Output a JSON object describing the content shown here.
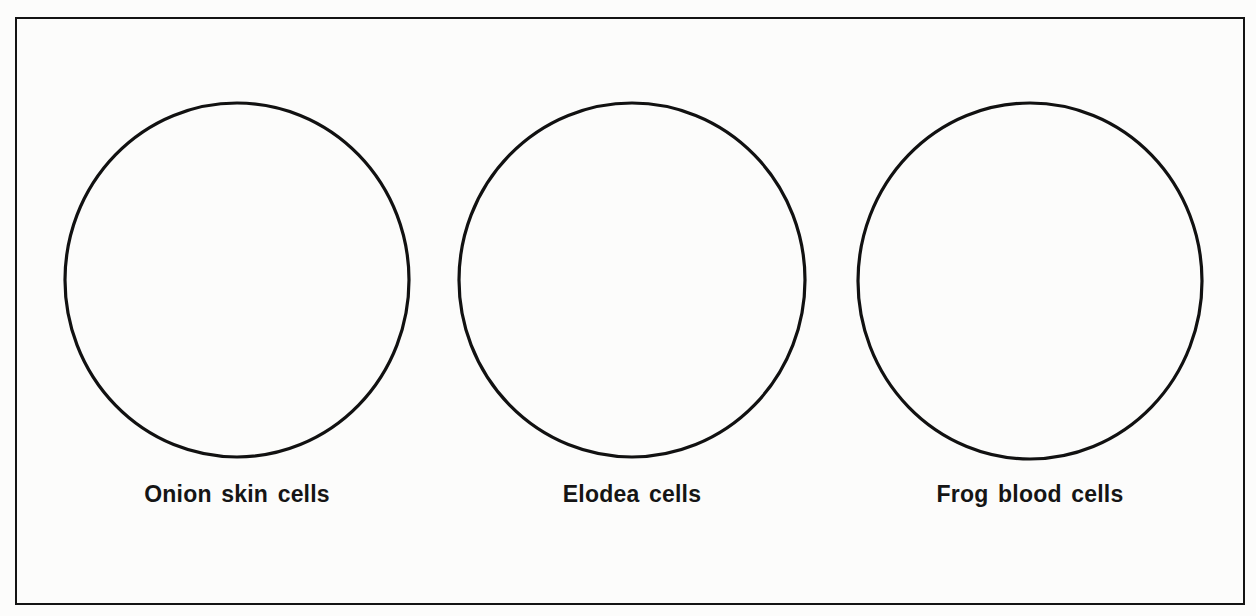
{
  "diagram": {
    "type": "worksheet-drawing-frames",
    "frame": {
      "stroke_color": "#141414",
      "background": "#fcfcfb"
    },
    "panels": [
      {
        "label": "Onion skin cells",
        "shape": "circle",
        "cx": 237,
        "cy": 280,
        "rx": 172,
        "ry": 177
      },
      {
        "label": "Elodea cells",
        "shape": "circle",
        "cx": 632,
        "cy": 280,
        "rx": 173,
        "ry": 177
      },
      {
        "label": "Frog blood cells",
        "shape": "circle",
        "cx": 1030,
        "cy": 281,
        "rx": 172,
        "ry": 178
      }
    ],
    "stroke_color": "#111111",
    "label_color": "#151515"
  }
}
